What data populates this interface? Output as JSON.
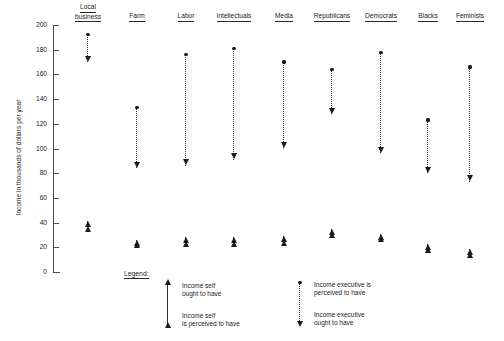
{
  "chart_data": {
    "type": "scatter",
    "title": "",
    "xlabel": "",
    "ylabel": "Income in thousands of dollars per year",
    "ylim": [
      0,
      200
    ],
    "yticks": [
      0,
      20,
      40,
      60,
      80,
      100,
      120,
      140,
      160,
      180,
      200
    ],
    "grid": false,
    "legend_position": "bottom-center",
    "categories": [
      "Local business",
      "Farm",
      "Labor",
      "Intellectuals",
      "Media",
      "Republicans",
      "Democrats",
      "Blacks",
      "Feminists"
    ],
    "series": [
      {
        "name": "Income executive is perceived to have",
        "marker": "dot",
        "values": [
          192,
          133,
          176,
          181,
          170,
          164,
          178,
          123,
          166
        ]
      },
      {
        "name": "Income executive ought to have",
        "marker": "arrow-down",
        "values": [
          170,
          84,
          86,
          91,
          100,
          128,
          96,
          80,
          73
        ]
      },
      {
        "name": "Income self ought to have",
        "marker": "arrow-up",
        "values": [
          41,
          26,
          28,
          28,
          29,
          35,
          31,
          23,
          19
        ]
      },
      {
        "name": "Income self is perceived to have",
        "marker": "arrow-up-small",
        "values": [
          37,
          24,
          25,
          25,
          26,
          32,
          29,
          20,
          16
        ]
      }
    ]
  },
  "axis": {
    "y_label": "Income in thousands of dollars per year",
    "tick_labels": [
      "200",
      "180",
      "160",
      "140",
      "120",
      "100",
      "80",
      "60",
      "40",
      "20",
      "0"
    ]
  },
  "columns": [
    {
      "label_lines": [
        "Local",
        "business"
      ]
    },
    {
      "label_lines": [
        "Farm"
      ]
    },
    {
      "label_lines": [
        "Labor"
      ]
    },
    {
      "label_lines": [
        "Intellectuals"
      ]
    },
    {
      "label_lines": [
        "Media"
      ]
    },
    {
      "label_lines": [
        "Republicans"
      ]
    },
    {
      "label_lines": [
        "Democrats"
      ]
    },
    {
      "label_lines": [
        "Blacks"
      ]
    },
    {
      "label_lines": [
        "Feminists"
      ]
    }
  ],
  "legend": {
    "title": "Legend:",
    "entries": [
      {
        "id": "self-ought",
        "lines": [
          "Income self",
          "ought to have"
        ]
      },
      {
        "id": "self-perceived",
        "lines": [
          "Income self",
          "is perceived to have"
        ]
      },
      {
        "id": "exec-perceived",
        "lines": [
          "Income executive is",
          "perceived to have"
        ]
      },
      {
        "id": "exec-ought",
        "lines": [
          "Income executive",
          "ought to have"
        ]
      }
    ]
  },
  "colors": {
    "marker": "#1a1a1a",
    "axis": "#4d4d4d",
    "connector": "#333333",
    "background": "#ffffff"
  }
}
